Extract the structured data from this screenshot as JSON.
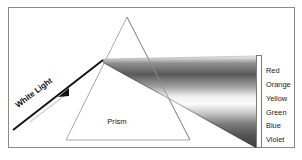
{
  "figure": {
    "title_alt": "Dispersion of white light through a prism",
    "frame": {
      "border_color": "#8a8a8a",
      "background": "#ffffff"
    },
    "incoming_ray": {
      "label": "White Light",
      "arrow_icon": "arrow-right-icon",
      "color": "#111111"
    },
    "prism": {
      "label": "Prism",
      "outline_color": "#9a9a9a"
    },
    "spectrum": {
      "band_outline_color": "#6b6b6b",
      "stops": [
        {
          "offset": "0%",
          "color": "#f2f2f2"
        },
        {
          "offset": "8%",
          "color": "#8e8e8e"
        },
        {
          "offset": "20%",
          "color": "#5a5a5a"
        },
        {
          "offset": "33%",
          "color": "#9e9e9e"
        },
        {
          "offset": "44%",
          "color": "#efefef"
        },
        {
          "offset": "52%",
          "color": "#fbfbfb"
        },
        {
          "offset": "62%",
          "color": "#c8c8c8"
        },
        {
          "offset": "74%",
          "color": "#7b7b7b"
        },
        {
          "offset": "86%",
          "color": "#545454"
        },
        {
          "offset": "100%",
          "color": "#3d3d3d"
        }
      ]
    },
    "color_labels": [
      {
        "name": "Red",
        "swatch": "#d83b2a"
      },
      {
        "name": "Orange",
        "swatch": "#e08a28"
      },
      {
        "name": "Yellow",
        "swatch": "#e8d33a"
      },
      {
        "name": "Green",
        "swatch": "#3f9d45"
      },
      {
        "name": "Blue",
        "swatch": "#2f56a8"
      },
      {
        "name": "Violet",
        "swatch": "#7a3fa0"
      }
    ]
  }
}
